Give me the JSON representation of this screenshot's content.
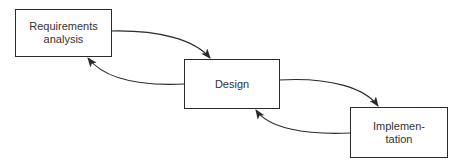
{
  "diagram": {
    "type": "waterfall-process-flow",
    "nodes": [
      {
        "id": "requirements",
        "label": "Requirements\nanalysis"
      },
      {
        "id": "design",
        "label": "Design"
      },
      {
        "id": "implementation",
        "label": "Implemen-\ntation"
      }
    ],
    "edges": [
      {
        "from": "requirements",
        "to": "design",
        "direction": "forward"
      },
      {
        "from": "design",
        "to": "requirements",
        "direction": "feedback"
      },
      {
        "from": "design",
        "to": "implementation",
        "direction": "forward"
      },
      {
        "from": "implementation",
        "to": "design",
        "direction": "feedback"
      }
    ],
    "colors": {
      "stroke": "#2a2a2a",
      "text": "#333333",
      "background": "#ffffff"
    }
  }
}
